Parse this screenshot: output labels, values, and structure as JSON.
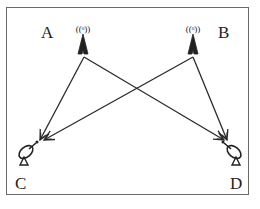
{
  "diagram": {
    "type": "wireless-links",
    "nodes": [
      {
        "id": "A",
        "label": "A",
        "kind": "transmitter-tower",
        "x": 83,
        "y": 50
      },
      {
        "id": "B",
        "label": "B",
        "kind": "transmitter-tower",
        "x": 193,
        "y": 50
      },
      {
        "id": "C",
        "label": "C",
        "kind": "satellite-dish-receiver",
        "x": 28,
        "y": 152
      },
      {
        "id": "D",
        "label": "D",
        "kind": "satellite-dish-receiver",
        "x": 233,
        "y": 152
      }
    ],
    "edges": [
      {
        "from": "A",
        "to": "C"
      },
      {
        "from": "A",
        "to": "D"
      },
      {
        "from": "B",
        "to": "C"
      },
      {
        "from": "B",
        "to": "D"
      }
    ],
    "colors": {
      "line": "#2a2a2a",
      "frame": "#6a6a6a",
      "background": "#ffffff"
    }
  },
  "labels": {
    "a": "A",
    "b": "B",
    "c": "C",
    "d": "D"
  }
}
